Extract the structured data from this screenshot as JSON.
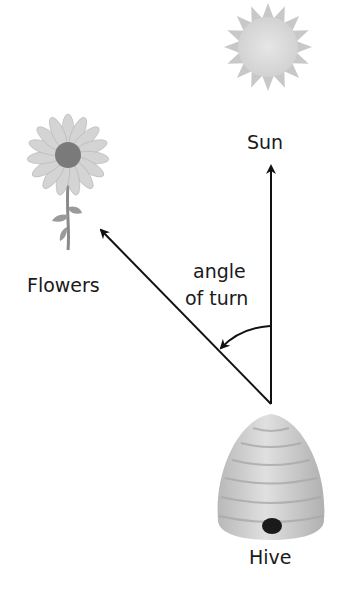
{
  "diagram": {
    "labels": {
      "sun": "Sun",
      "flowers": "Flowers",
      "angle_line1": "angle",
      "angle_line2": "of turn",
      "hive": "Hive"
    },
    "icons": [
      "sun-icon",
      "flower-icon",
      "beehive-icon"
    ],
    "colors": {
      "line": "#111111",
      "text": "#1a1a1a",
      "sun": "#d9d9d9",
      "hive": "#cfcfcf",
      "flower_center": "#777777"
    }
  }
}
